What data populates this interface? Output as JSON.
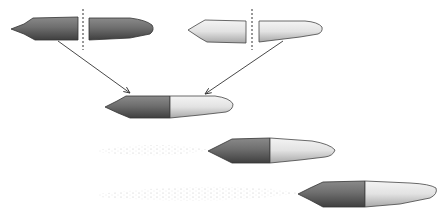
{
  "figure": {
    "colors": {
      "dark_tissue": "#6e6e6e",
      "dark_shade": "#4a4a4a",
      "light_tissue": "#e6e6e6",
      "light_shade": "#bdbdbd",
      "outline": "#2e2e2e",
      "arrow": "#3a3a3a",
      "cut_line": "#333333",
      "trail": "#b5b5b5"
    },
    "specimens": [
      {
        "id": "donor-dark",
        "label": "",
        "anterior": "dark",
        "posterior": "dark",
        "cut": true
      },
      {
        "id": "donor-light",
        "label": "",
        "anterior": "light",
        "posterior": "light",
        "cut": true
      },
      {
        "id": "graft",
        "label": "",
        "anterior": "dark",
        "posterior": "light",
        "cut": false
      },
      {
        "id": "graft-moving-1",
        "label": "",
        "anterior": "dark",
        "posterior": "light",
        "trail": true
      },
      {
        "id": "graft-moving-2",
        "label": "",
        "anterior": "dark",
        "posterior": "light",
        "trail": true
      }
    ]
  }
}
